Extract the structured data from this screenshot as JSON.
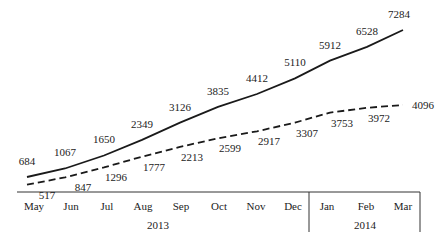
{
  "chart_data": {
    "type": "line",
    "title": "",
    "xlabel": "",
    "ylabel": "",
    "grid": false,
    "legend": null,
    "categories": [
      "May",
      "Jun",
      "Jul",
      "Aug",
      "Sep",
      "Oct",
      "Nov",
      "Dec",
      "Jan",
      "Feb",
      "Mar"
    ],
    "year_groups": [
      {
        "label": "2013",
        "months": [
          "May",
          "Jun",
          "Jul",
          "Aug",
          "Sep",
          "Oct",
          "Nov",
          "Dec"
        ]
      },
      {
        "label": "2014",
        "months": [
          "Jan",
          "Feb",
          "Mar"
        ]
      }
    ],
    "series": [
      {
        "name": "solid",
        "style": "solid",
        "values": [
          684,
          1067,
          1650,
          2349,
          3126,
          3835,
          4412,
          5110,
          5912,
          6528,
          7284
        ]
      },
      {
        "name": "dashed",
        "style": "dashed",
        "values": [
          517,
          847,
          1296,
          1777,
          2213,
          2599,
          2917,
          3307,
          3753,
          3972,
          4096
        ]
      }
    ],
    "ylim": [
      0,
      8000
    ]
  },
  "colors": {
    "line": "#1a1a1a",
    "text": "#222222",
    "axis": "#333333"
  }
}
